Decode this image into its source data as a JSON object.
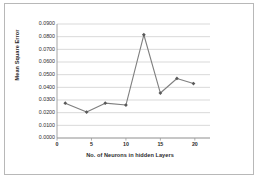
{
  "chart_data": {
    "type": "line",
    "title": "",
    "xlabel": "No. of Neurons in hidden Layers",
    "ylabel": "Mean Square Error",
    "x": [
      1.2,
      4.3,
      7.0,
      10.0,
      12.6,
      15.0,
      17.4,
      19.8
    ],
    "values": [
      0.0275,
      0.0205,
      0.0275,
      0.026,
      0.0815,
      0.0355,
      0.047,
      0.043
    ],
    "series": [
      {
        "name": "Mean Square Error",
        "values": [
          0.0275,
          0.0205,
          0.0275,
          0.026,
          0.0815,
          0.0355,
          0.047,
          0.043
        ]
      }
    ],
    "xlim": [
      0,
      22.2
    ],
    "ylim": [
      0.0,
      0.09
    ],
    "xticks": [
      0,
      5,
      10,
      15,
      20
    ],
    "xtick_labels": [
      "0",
      "5",
      "10",
      "15",
      "20"
    ],
    "yticks": [
      0.0,
      0.01,
      0.02,
      0.03,
      0.04,
      0.05,
      0.06,
      0.07,
      0.08,
      0.09
    ],
    "ytick_labels": [
      "0.0000",
      "0.0100",
      "0.0200",
      "0.0300",
      "0.0400",
      "0.0500",
      "0.0600",
      "0.0700",
      "0.0800",
      "0.0900"
    ],
    "grid": "horizontal",
    "legend": "none",
    "line_color": "#7f7f7f",
    "marker": "diamond",
    "marker_color": "#595959",
    "grid_color": "#c8c8c8",
    "axis_color": "#9a9a9a",
    "frame_color": "#b8b8b8",
    "background": "#ffffff"
  }
}
